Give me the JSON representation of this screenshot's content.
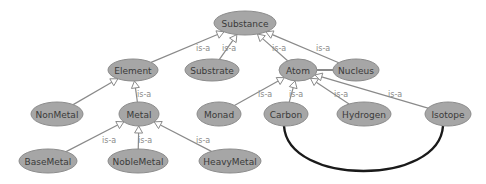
{
  "diagram": {
    "type": "ontology-graph",
    "colors": {
      "node_fill": "#a6a6a6",
      "edge": "#8a8a8a",
      "label": "#8a8a8a",
      "curve": "#1a1a1a"
    },
    "nodes": [
      {
        "id": "Substance",
        "label": "Substance",
        "x": 245,
        "y": 23,
        "rx": 31,
        "ry": 12
      },
      {
        "id": "Element",
        "label": "Element",
        "x": 133,
        "y": 70,
        "rx": 25,
        "ry": 11
      },
      {
        "id": "Substrate",
        "label": "Substrate",
        "x": 212,
        "y": 70,
        "rx": 27,
        "ry": 11
      },
      {
        "id": "Atom",
        "label": "Atom",
        "x": 298,
        "y": 70,
        "rx": 19,
        "ry": 11
      },
      {
        "id": "Nucleus",
        "label": "Nucleus",
        "x": 356,
        "y": 70,
        "rx": 23,
        "ry": 11
      },
      {
        "id": "NonMetal",
        "label": "NonMetal",
        "x": 57,
        "y": 114,
        "rx": 26,
        "ry": 12
      },
      {
        "id": "Metal",
        "label": "Metal",
        "x": 139,
        "y": 114,
        "rx": 20,
        "ry": 12
      },
      {
        "id": "Monad",
        "label": "Monad",
        "x": 219,
        "y": 114,
        "rx": 22,
        "ry": 12
      },
      {
        "id": "Carbon",
        "label": "Carbon",
        "x": 286,
        "y": 114,
        "rx": 22,
        "ry": 12
      },
      {
        "id": "Hydrogen",
        "label": "Hydrogen",
        "x": 364,
        "y": 114,
        "rx": 27,
        "ry": 12
      },
      {
        "id": "Isotope",
        "label": "Isotope",
        "x": 448,
        "y": 114,
        "rx": 23,
        "ry": 12
      },
      {
        "id": "BaseMetal",
        "label": "BaseMetal",
        "x": 48,
        "y": 161,
        "rx": 29,
        "ry": 12
      },
      {
        "id": "NobleMetal",
        "label": "NobleMetal",
        "x": 138,
        "y": 161,
        "rx": 30,
        "ry": 12
      },
      {
        "id": "HeavyMetal",
        "label": "HeavyMetal",
        "x": 230,
        "y": 161,
        "rx": 31,
        "ry": 12
      }
    ],
    "edges": [
      {
        "from": "Element",
        "to": "Substance",
        "label": "",
        "kind": "is-a",
        "lx": 0,
        "ly": 0
      },
      {
        "from": "Substrate",
        "to": "Substance",
        "label": "is-a",
        "kind": "is-a",
        "lx": 196,
        "ly": 51
      },
      {
        "from": "Substrate",
        "to": "Substance",
        "label": "is-a",
        "kind": "is-a-label-only",
        "lx": 222,
        "ly": 51
      },
      {
        "from": "Atom",
        "to": "Substance",
        "label": "is-a",
        "kind": "is-a",
        "lx": 272,
        "ly": 51
      },
      {
        "from": "Nucleus",
        "to": "Substance",
        "label": "is-a",
        "kind": "is-a",
        "lx": 316,
        "ly": 51
      },
      {
        "from": "NonMetal",
        "to": "Element",
        "label": "",
        "kind": "is-a",
        "lx": 0,
        "ly": 0
      },
      {
        "from": "Metal",
        "to": "Element",
        "label": "is-a",
        "kind": "is-a",
        "lx": 137,
        "ly": 97
      },
      {
        "from": "BaseMetal",
        "to": "Metal",
        "label": "is-a",
        "kind": "is-a",
        "lx": 102,
        "ly": 143
      },
      {
        "from": "NobleMetal",
        "to": "Metal",
        "label": "is-a",
        "kind": "is-a",
        "lx": 138,
        "ly": 143
      },
      {
        "from": "HeavyMetal",
        "to": "Metal",
        "label": "is-a",
        "kind": "is-a",
        "lx": 196,
        "ly": 143
      },
      {
        "from": "Monad",
        "to": "Atom",
        "label": "is-a",
        "kind": "is-a",
        "lx": 258,
        "ly": 97
      },
      {
        "from": "Carbon",
        "to": "Atom",
        "label": "is-a",
        "kind": "is-a",
        "lx": 289,
        "ly": 97
      },
      {
        "from": "Hydrogen",
        "to": "Atom",
        "label": "is-a",
        "kind": "is-a",
        "lx": 334,
        "ly": 97
      },
      {
        "from": "Isotope",
        "to": "Atom",
        "label": "is-a",
        "kind": "is-a",
        "lx": 388,
        "ly": 97
      },
      {
        "from": "Atom",
        "to": "Nucleus",
        "label": "",
        "kind": "association",
        "lx": 0,
        "ly": 0
      }
    ],
    "curves": [
      {
        "from": "Carbon",
        "to": "Isotope",
        "label": ""
      }
    ]
  }
}
